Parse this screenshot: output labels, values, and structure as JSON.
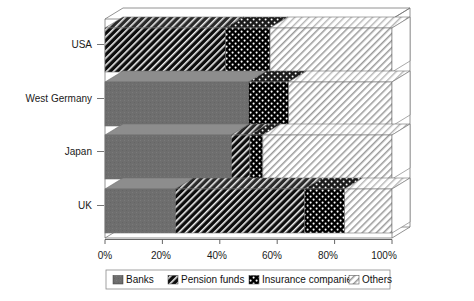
{
  "chart_data": {
    "type": "bar",
    "orientation": "horizontal",
    "stacked": true,
    "normalized": true,
    "three_d": true,
    "title": "",
    "subtitle": "",
    "xlabel": "",
    "ylabel": "",
    "categories": [
      "USA",
      "West Germany",
      "Japan",
      "UK"
    ],
    "series": [
      {
        "name": "Banks",
        "values": [
          0.0,
          50.0,
          44.0,
          24.5
        ]
      },
      {
        "name": "Pension funds",
        "values": [
          42.0,
          0.0,
          6.5,
          45.0
        ]
      },
      {
        "name": "Insurance companies",
        "values": [
          15.5,
          14.0,
          4.5,
          14.0
        ]
      },
      {
        "name": "Others",
        "values": [
          42.5,
          36.0,
          45.0,
          16.5
        ]
      }
    ],
    "xlim": [
      0,
      100
    ],
    "xtick_values": [
      0,
      20,
      40,
      60,
      80,
      100
    ],
    "xtick_labels": [
      "0%",
      "20%",
      "40%",
      "60%",
      "80%",
      "100%"
    ],
    "grid": false,
    "legend_position": "bottom",
    "legend_entries": [
      {
        "label": "Banks",
        "pattern": "solid-gray"
      },
      {
        "label": "Pension funds",
        "pattern": "dense-diagonal-hatch"
      },
      {
        "label": "Insurance companies",
        "pattern": "black-dots"
      },
      {
        "label": "Others",
        "pattern": "light-diagonal-hatch"
      }
    ],
    "colors": {
      "banks": "#6e6e6e",
      "pension_funds": "#111111",
      "insurance_companies": "#000000",
      "others": "#ffffff",
      "axis": "#555555",
      "frame": "#777777",
      "text": "#1a1a1a"
    }
  },
  "axis": {
    "ticks": [
      "0%",
      "20%",
      "40%",
      "60%",
      "80%",
      "100%"
    ]
  },
  "categories": {
    "usa": "USA",
    "west_germany": "West Germany",
    "japan": "Japan",
    "uk": "UK"
  },
  "legend": {
    "banks": "Banks",
    "pension_funds": "Pension funds",
    "insurance_companies": "Insurance companies",
    "others": "Others"
  }
}
